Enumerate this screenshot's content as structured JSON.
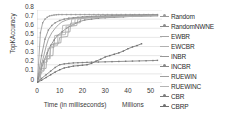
{
  "chart_data": {
    "type": "line",
    "title": "",
    "xlabel": "Time (in milliseconds)",
    "ylabel": "TopKAccuracy",
    "x_units_label": "Millions",
    "xlim": [
      0,
      55
    ],
    "ylim": [
      0,
      0.8
    ],
    "xticks": [
      0,
      10,
      20,
      30,
      40,
      50
    ],
    "xtick_labels": [
      "0",
      "10",
      "20",
      "30",
      "40",
      "50"
    ],
    "yticks": [
      0,
      0.1,
      0.2,
      0.3,
      0.4,
      0.5,
      0.6,
      0.7,
      0.8
    ],
    "ytick_labels": [
      "0",
      "0.1",
      "0.2",
      "0.3",
      "0.4",
      "0.5",
      "0.6",
      "0.7",
      "0.8"
    ],
    "grid": "horizontal",
    "legend_position": "right",
    "series": [
      {
        "name": "Random",
        "color": "#9a9a9a",
        "marker": "dot",
        "x": [
          0.3,
          1.5,
          2.5,
          3.5,
          4.5,
          5.5,
          6.5,
          7.5,
          8.5,
          9.5,
          11,
          13,
          15,
          17,
          19,
          21,
          23,
          25,
          27,
          29,
          31,
          33,
          35,
          37,
          39,
          41,
          43,
          45,
          47,
          49,
          51,
          53
        ],
        "y": [
          0.05,
          0.55,
          0.66,
          0.7,
          0.72,
          0.735,
          0.74,
          0.745,
          0.748,
          0.75,
          0.75,
          0.75,
          0.75,
          0.75,
          0.75,
          0.75,
          0.75,
          0.75,
          0.75,
          0.75,
          0.75,
          0.75,
          0.75,
          0.75,
          0.75,
          0.75,
          0.75,
          0.75,
          0.75,
          0.75,
          0.75,
          0.75
        ]
      },
      {
        "name": "RandomNWNE",
        "color": "#8c8c8c",
        "marker": "dot",
        "x": [
          0.3,
          2,
          3.5,
          5,
          6.5,
          8,
          10,
          12,
          14,
          16,
          18,
          20,
          22,
          24,
          26,
          28,
          30,
          33,
          36,
          39,
          42,
          45,
          48,
          51,
          53
        ],
        "y": [
          0.04,
          0.3,
          0.48,
          0.58,
          0.63,
          0.66,
          0.685,
          0.7,
          0.71,
          0.715,
          0.72,
          0.725,
          0.728,
          0.73,
          0.732,
          0.734,
          0.736,
          0.738,
          0.74,
          0.742,
          0.744,
          0.745,
          0.746,
          0.747,
          0.748
        ]
      },
      {
        "name": "EWBR",
        "color": "#a5a5a5",
        "marker": "none",
        "x": [
          0.3,
          1.2,
          2.2,
          3.0,
          3.2,
          5.5,
          6.0,
          9.5,
          10.0,
          13.5,
          14.0,
          17.5,
          18.0,
          22,
          26,
          30,
          36,
          42,
          48,
          53
        ],
        "y": [
          0.03,
          0.09,
          0.12,
          0.13,
          0.26,
          0.27,
          0.42,
          0.43,
          0.5,
          0.51,
          0.62,
          0.63,
          0.7,
          0.715,
          0.72,
          0.725,
          0.73,
          0.735,
          0.74,
          0.742
        ]
      },
      {
        "name": "EWCBR",
        "color": "#b0b0b0",
        "marker": "none",
        "x": [
          0.3,
          1.0,
          1.8,
          2.0,
          4.5,
          4.8,
          7.5,
          7.8,
          11,
          11.3,
          15,
          15.3,
          19,
          24,
          29,
          35,
          41,
          47,
          53
        ],
        "y": [
          0.02,
          0.07,
          0.1,
          0.22,
          0.23,
          0.38,
          0.39,
          0.52,
          0.53,
          0.63,
          0.64,
          0.7,
          0.715,
          0.72,
          0.725,
          0.73,
          0.735,
          0.738,
          0.74
        ]
      },
      {
        "name": "INBR",
        "color": "#979797",
        "marker": "none",
        "x": [
          0.3,
          1.0,
          2.0,
          3.0,
          4.0,
          5.0,
          6.5,
          8.0,
          9.5,
          11,
          13,
          15,
          18,
          21,
          25,
          30,
          36,
          42,
          48,
          53
        ],
        "y": [
          0.03,
          0.1,
          0.2,
          0.3,
          0.4,
          0.48,
          0.55,
          0.6,
          0.64,
          0.67,
          0.69,
          0.705,
          0.715,
          0.72,
          0.725,
          0.73,
          0.735,
          0.738,
          0.74,
          0.742
        ]
      },
      {
        "name": "INCBR",
        "color": "#888888",
        "marker": "dot",
        "x": [
          0.3,
          1.5,
          3.0,
          4.5,
          6.0,
          7.5,
          9.0,
          11,
          13,
          15,
          17,
          19,
          21,
          24,
          27,
          30,
          34,
          38,
          42,
          46,
          50,
          53
        ],
        "y": [
          0.02,
          0.12,
          0.24,
          0.33,
          0.41,
          0.47,
          0.52,
          0.56,
          0.6,
          0.63,
          0.655,
          0.675,
          0.69,
          0.7,
          0.71,
          0.715,
          0.72,
          0.725,
          0.73,
          0.733,
          0.736,
          0.738
        ]
      },
      {
        "name": "RUEWIN",
        "color": "#a0a0a0",
        "marker": "none",
        "x": [
          0.3,
          1.5,
          1.8,
          4.0,
          4.3,
          7.0,
          7.3,
          10.5,
          10.8,
          14.5,
          14.8,
          19,
          19.3,
          24,
          29,
          35,
          41,
          47,
          53
        ],
        "y": [
          0.02,
          0.05,
          0.155,
          0.16,
          0.295,
          0.3,
          0.435,
          0.44,
          0.555,
          0.56,
          0.655,
          0.66,
          0.71,
          0.715,
          0.72,
          0.725,
          0.73,
          0.735,
          0.738
        ]
      },
      {
        "name": "RUEWINC",
        "color": "#b5b5b5",
        "marker": "none",
        "x": [
          0.3,
          1.2,
          1.4,
          3.2,
          3.4,
          5.8,
          6.0,
          9.0,
          9.2,
          12.5,
          12.8,
          16.5,
          16.8,
          21,
          26,
          32,
          38,
          45,
          53
        ],
        "y": [
          0.02,
          0.04,
          0.135,
          0.14,
          0.26,
          0.265,
          0.4,
          0.41,
          0.525,
          0.53,
          0.625,
          0.63,
          0.705,
          0.712,
          0.718,
          0.724,
          0.728,
          0.732,
          0.736
        ]
      },
      {
        "name": "CBR",
        "color": "#7d7d7d",
        "marker": "dot",
        "x": [
          0.3,
          2,
          4,
          6,
          8,
          10,
          12,
          14,
          16,
          18,
          20,
          22,
          24,
          27,
          30,
          33,
          36,
          39,
          42,
          45,
          48,
          51,
          53
        ],
        "y": [
          0.01,
          0.05,
          0.09,
          0.13,
          0.17,
          0.2,
          0.21,
          0.215,
          0.22,
          0.222,
          0.224,
          0.226,
          0.228,
          0.23,
          0.232,
          0.234,
          0.236,
          0.238,
          0.24,
          0.242,
          0.244,
          0.246,
          0.248
        ]
      },
      {
        "name": "CBRP",
        "color": "#707070",
        "marker": "dot",
        "x": [
          0.3,
          2,
          4,
          6,
          8,
          10,
          12,
          14,
          16,
          18,
          20,
          22,
          24,
          26,
          28,
          30,
          32,
          34,
          36,
          38,
          40,
          42,
          44,
          46
        ],
        "y": [
          0.01,
          0.03,
          0.06,
          0.09,
          0.12,
          0.145,
          0.165,
          0.175,
          0.185,
          0.19,
          0.195,
          0.2,
          0.215,
          0.24,
          0.26,
          0.285,
          0.3,
          0.315,
          0.33,
          0.35,
          0.375,
          0.395,
          0.41,
          0.43
        ]
      }
    ]
  },
  "legend": {
    "items": [
      {
        "label": "Random",
        "color": "#9a9a9a",
        "marker": "dot"
      },
      {
        "label": "RandomNWNE",
        "color": "#8c8c8c",
        "marker": "dot"
      },
      {
        "label": "EWBR",
        "color": "#a5a5a5",
        "marker": "none"
      },
      {
        "label": "EWCBR",
        "color": "#b0b0b0",
        "marker": "none"
      },
      {
        "label": "INBR",
        "color": "#979797",
        "marker": "none"
      },
      {
        "label": "INCBR",
        "color": "#888888",
        "marker": "dot"
      },
      {
        "label": "RUEWIN",
        "color": "#a0a0a0",
        "marker": "none"
      },
      {
        "label": "RUEWINC",
        "color": "#b5b5b5",
        "marker": "none"
      },
      {
        "label": "CBR",
        "color": "#7d7d7d",
        "marker": "dot"
      },
      {
        "label": "CBRP",
        "color": "#707070",
        "marker": "dot"
      }
    ]
  },
  "colors": {
    "grid": "#d9d9d9",
    "axis": "#bfbfbf",
    "text": "#3a3a3a",
    "background": "#ffffff"
  }
}
